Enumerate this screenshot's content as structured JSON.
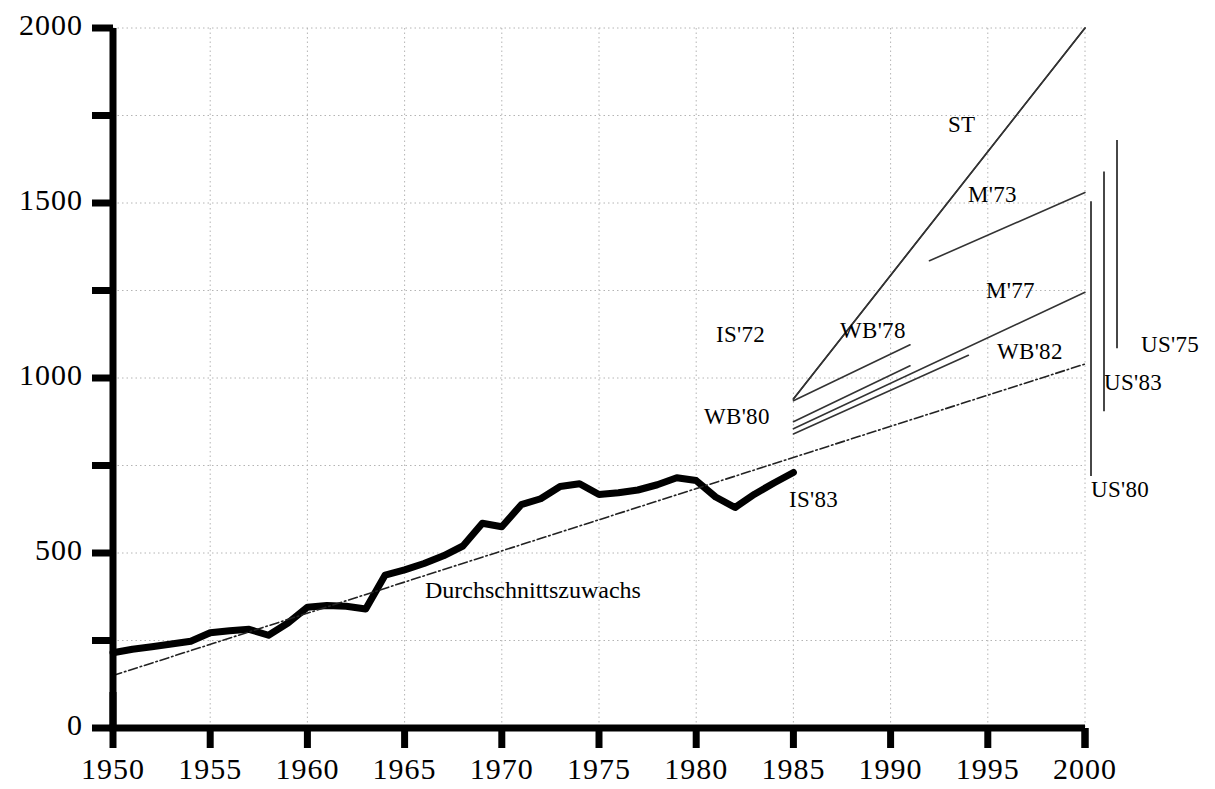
{
  "chart_data": {
    "type": "line",
    "title": "",
    "xlabel": "",
    "ylabel": "",
    "xlim": [
      1950,
      2000
    ],
    "ylim": [
      0,
      2000
    ],
    "grid": true,
    "legend_position": "inline-annotations",
    "x_ticks": [
      1950,
      1955,
      1960,
      1965,
      1970,
      1975,
      1980,
      1985,
      1990,
      1995,
      2000
    ],
    "x_tick_labels": [
      "1950",
      "1955",
      "1960",
      "1965",
      "1970",
      "1975",
      "1980",
      "1985",
      "1990",
      "1995",
      "2000"
    ],
    "y_ticks": [
      0,
      500,
      1000,
      1500,
      2000
    ],
    "y_tick_labels": [
      "0",
      "500",
      "1000",
      "1500",
      "2000"
    ],
    "y_minor_ticks": [
      250,
      750,
      1250,
      1750
    ],
    "series": [
      {
        "name": "IS'83",
        "label": "IS'83",
        "style": "thick-solid",
        "x": [
          1950,
          1951,
          1952,
          1953,
          1954,
          1955,
          1956,
          1957,
          1958,
          1959,
          1960,
          1961,
          1962,
          1963,
          1964,
          1965,
          1966,
          1967,
          1968,
          1969,
          1970,
          1971,
          1972,
          1973,
          1974,
          1975,
          1976,
          1977,
          1978,
          1979,
          1980,
          1981,
          1982,
          1983,
          1984,
          1985
        ],
        "values": [
          215,
          225,
          232,
          240,
          248,
          272,
          278,
          282,
          265,
          300,
          345,
          350,
          348,
          340,
          437,
          452,
          470,
          492,
          520,
          585,
          575,
          638,
          655,
          690,
          698,
          667,
          672,
          680,
          695,
          715,
          707,
          660,
          630,
          668,
          700,
          730
        ]
      },
      {
        "name": "Durchschnittszuwachs",
        "label": "Durchschnittszuwachs",
        "style": "dash-dot",
        "x": [
          1950,
          2000
        ],
        "values": [
          150,
          1040
        ]
      },
      {
        "name": "ST",
        "label": "ST",
        "style": "thin-solid",
        "x": [
          1985,
          2000
        ],
        "values": [
          940,
          2000
        ]
      },
      {
        "name": "M'73",
        "label": "M'73",
        "style": "thin-solid",
        "x": [
          1992,
          2000
        ],
        "values": [
          1335,
          1530
        ]
      },
      {
        "name": "M'77",
        "label": "M'77",
        "style": "thin-solid",
        "x": [
          1985,
          2000
        ],
        "values": [
          855,
          1245
        ]
      },
      {
        "name": "IS'72",
        "label": "IS'72",
        "style": "thin-solid",
        "x": [
          1985,
          2000
        ],
        "values": [
          940,
          2000
        ]
      },
      {
        "name": "WB'78",
        "label": "WB'78",
        "style": "thin-solid",
        "x": [
          1985,
          1991
        ],
        "values": [
          935,
          1095
        ]
      },
      {
        "name": "WB'80",
        "label": "WB'80",
        "style": "thin-solid",
        "x": [
          1985,
          1991
        ],
        "values": [
          875,
          1035
        ]
      },
      {
        "name": "WB'82",
        "label": "WB'82",
        "style": "thin-solid",
        "x": [
          1985,
          1994
        ],
        "values": [
          840,
          1065
        ]
      }
    ],
    "range_bars": [
      {
        "name": "US'80",
        "label": "US'80",
        "x": 1091,
        "low": 720,
        "high": 1505
      },
      {
        "name": "US'83",
        "label": "US'83",
        "x": 1104,
        "low": 905,
        "high": 1590
      },
      {
        "name": "US'75",
        "label": "US'75",
        "x": 1117,
        "low": 1085,
        "high": 1680
      }
    ],
    "annotations": [
      {
        "name": "ST",
        "text": "ST",
        "x_px": 948,
        "y_px": 112
      },
      {
        "name": "M73",
        "text": "M'73",
        "x_px": 968,
        "y_px": 182
      },
      {
        "name": "M77",
        "text": "M'77",
        "x_px": 986,
        "y_px": 278
      },
      {
        "name": "IS72",
        "text": "IS'72",
        "x_px": 716,
        "y_px": 322
      },
      {
        "name": "WB78",
        "text": "WB'78",
        "x_px": 840,
        "y_px": 318
      },
      {
        "name": "WB82",
        "text": "WB'82",
        "x_px": 997,
        "y_px": 339
      },
      {
        "name": "WB80",
        "text": "WB'80",
        "x_px": 704,
        "y_px": 404
      },
      {
        "name": "IS83",
        "text": "IS'83",
        "x_px": 789,
        "y_px": 487
      },
      {
        "name": "US75",
        "text": "US'75",
        "x_px": 1141,
        "y_px": 332
      },
      {
        "name": "US83",
        "text": "US'83",
        "x_px": 1104,
        "y_px": 370
      },
      {
        "name": "US80",
        "text": "US'80",
        "x_px": 1091,
        "y_px": 477
      },
      {
        "name": "Durchschnittszuwachs",
        "text": "Durchschnittszuwachs",
        "x_px": 425,
        "y_px": 577
      }
    ],
    "colors": {
      "axis": "#000000",
      "grid": "#b4b4b4",
      "data_line": "#000000",
      "trend_line": "#222222",
      "projection_line": "#333333",
      "background": "#ffffff"
    }
  },
  "geometry": {
    "plot_left_px": 113,
    "plot_right_px": 1085,
    "plot_top_px": 28,
    "plot_bottom_px": 728
  }
}
